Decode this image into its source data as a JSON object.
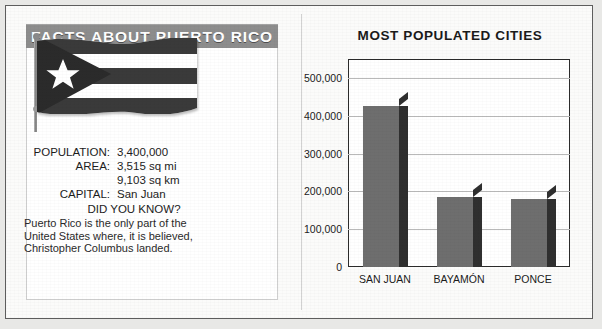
{
  "header": {
    "banner_title": "FACTS ABOUT PUERTO RICO"
  },
  "flag": {
    "name": "puerto-rico-flag",
    "stripe_colors": [
      "#3a3a3a",
      "#ffffff",
      "#3a3a3a",
      "#ffffff",
      "#3a3a3a"
    ],
    "triangle_color": "#2b2b2b",
    "star_color": "#ffffff"
  },
  "facts": {
    "rows": [
      {
        "label": "POPULATION:",
        "value": "3,400,000"
      },
      {
        "label": "AREA:",
        "value": "3,515 sq mi"
      },
      {
        "label": "",
        "value": "9,103 sq km"
      },
      {
        "label": "CAPITAL:",
        "value": "San Juan"
      }
    ],
    "did_you_know_heading": "DID YOU KNOW?",
    "blurb_lines": [
      "Puerto Rico is the only part of the",
      "United States where, it is believed,",
      "Christopher Columbus landed."
    ]
  },
  "chart_data": {
    "type": "bar",
    "title": "MOST POPULATED CITIES",
    "xlabel": "",
    "ylabel": "",
    "categories": [
      "SAN JUAN",
      "BAYAMÓN",
      "PONCE"
    ],
    "values": [
      425000,
      185000,
      180000
    ],
    "ytick_labels": [
      "500,000",
      "400,000",
      "300,000",
      "200,000",
      "100,000",
      "0"
    ],
    "ytick_values": [
      500000,
      400000,
      300000,
      200000,
      100000,
      0
    ],
    "ylim": [
      0,
      550000
    ],
    "grid": true,
    "legend": "none",
    "bar_face_color": "#6e6e6e",
    "bar_side_color": "#2f2f2f"
  },
  "colors": {
    "banner_background": "#8d8d8d",
    "banner_text": "#ffffff",
    "page_background": "#fbfbfa",
    "frame": "#2b2b2b"
  }
}
